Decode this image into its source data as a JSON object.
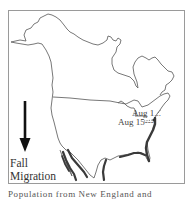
{
  "map": {
    "title": "Fall Migration",
    "region": "North America",
    "legend": {
      "arrow_icon": "arrow-down-icon",
      "line1": "Fall",
      "line2": "Migration"
    },
    "date_labels": [
      {
        "text": "Aug 1..."
      },
      {
        "text": "Aug 15---"
      }
    ],
    "colors": {
      "outline": "#555555",
      "route": "#3a3a3a",
      "frame": "#9a9a9a"
    }
  },
  "caption": {
    "text": "Population from New England and"
  }
}
